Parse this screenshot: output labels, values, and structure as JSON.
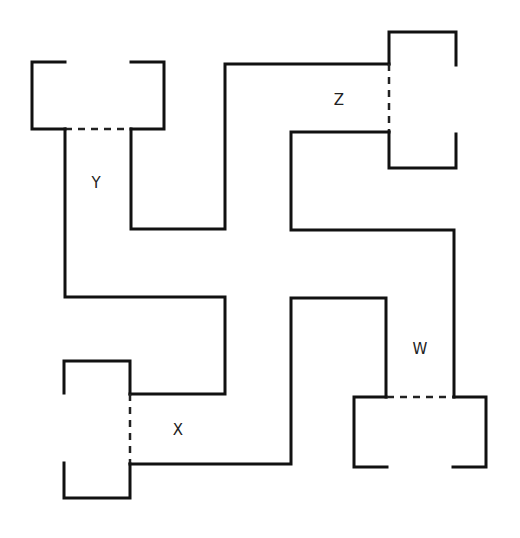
{
  "diagram": {
    "type": "floor-plan-maze",
    "stroke_color": "#111111",
    "background": "#ffffff",
    "labels": {
      "Y": "Y",
      "Z": "Z",
      "X": "X",
      "W": "W"
    },
    "rooms": [
      {
        "id": "room-y",
        "label": "Y",
        "position": "top-left"
      },
      {
        "id": "room-z",
        "label": "Z",
        "position": "top-right"
      },
      {
        "id": "room-x",
        "label": "X",
        "position": "bottom-left"
      },
      {
        "id": "room-w",
        "label": "W",
        "position": "bottom-right"
      }
    ],
    "doors": [
      {
        "room": "Y",
        "style": "dashed",
        "side": "bottom"
      },
      {
        "room": "Z",
        "style": "dashed",
        "side": "left"
      },
      {
        "room": "X",
        "style": "dashed",
        "side": "right"
      },
      {
        "room": "W",
        "style": "dashed",
        "side": "top"
      }
    ]
  }
}
